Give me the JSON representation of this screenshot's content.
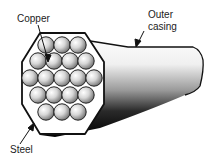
{
  "diagram": {
    "labels": {
      "copper": "Copper",
      "outer_casing_line1": "Outer",
      "outer_casing_line2": "casing",
      "steel": "Steel"
    },
    "wire_rows": [
      3,
      4,
      5,
      4,
      3
    ],
    "wire_count": 19,
    "colors": {
      "casing_outline": "#111111",
      "wire_light": "#f4f4f4",
      "wire_dark": "#8a8a8a",
      "shadow": "#000000"
    }
  }
}
